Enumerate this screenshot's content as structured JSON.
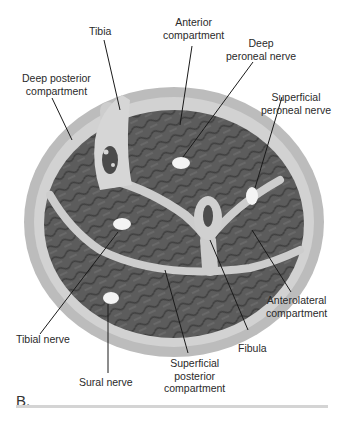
{
  "figure": {
    "panel_label": "B.",
    "colors": {
      "skin": "#b9b9b9",
      "fascia": "#cfcfcf",
      "muscle": "#5a5a5a",
      "nerve": "#f4f4f4",
      "leader_line": "#1a1a1a"
    },
    "labels": {
      "tibia": "Tibia",
      "anterior_compartment": [
        "Anterior",
        "compartment"
      ],
      "deep_peroneal_nerve": [
        "Deep",
        "peroneal nerve"
      ],
      "superficial_peroneal_nerve": [
        "Superficial",
        "peroneal nerve"
      ],
      "deep_posterior_compartment": [
        "Deep posterior",
        "compartment"
      ],
      "anterolateral_compartment": [
        "Anterolateral",
        "compartment"
      ],
      "tibial_nerve": "Tibial nerve",
      "fibula": "Fibula",
      "sural_nerve": "Sural nerve",
      "superficial_posterior_compartment": [
        "Superficial",
        "posterior",
        "compartment"
      ]
    }
  }
}
